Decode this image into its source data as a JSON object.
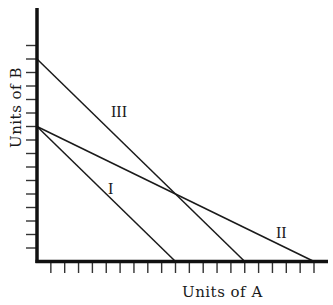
{
  "chart_data": {
    "type": "line",
    "title": "",
    "xlabel": "Units of A",
    "ylabel": "Units of B",
    "xlim": [
      0,
      21
    ],
    "ylim": [
      0,
      16
    ],
    "x_ticks": [
      1,
      2,
      3,
      4,
      5,
      6,
      7,
      8,
      9,
      10,
      11,
      12,
      13,
      14,
      15,
      16,
      17,
      18,
      19,
      20
    ],
    "y_ticks": [
      1,
      2,
      3,
      4,
      5,
      6,
      7,
      8,
      9,
      10,
      11,
      12,
      13,
      14,
      15,
      16
    ],
    "tick_labels_shown": false,
    "grid": false,
    "legend": "none (lines labeled inline)",
    "series": [
      {
        "name": "I",
        "x": [
          0,
          10
        ],
        "y": [
          10,
          0
        ],
        "label_position": [
          5.2,
          5.5
        ]
      },
      {
        "name": "II",
        "x": [
          0,
          20
        ],
        "y": [
          10,
          0
        ],
        "label_position": [
          17.5,
          1.6
        ]
      },
      {
        "name": "III",
        "x": [
          0,
          15
        ],
        "y": [
          15,
          0
        ],
        "label_position": [
          5.8,
          11
        ]
      }
    ],
    "annotations": [
      {
        "text": "Intersection of II and III",
        "x": 10,
        "y": 5,
        "shown_as_text": false
      }
    ]
  },
  "labels": {
    "x_axis": "Units of A",
    "y_axis": "Units of B",
    "line_I": "I",
    "line_II": "II",
    "line_III": "III"
  }
}
